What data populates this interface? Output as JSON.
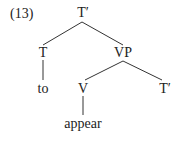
{
  "example_number": "(13)",
  "tree": {
    "root": {
      "label": "T′"
    },
    "t_head": {
      "label": "T",
      "terminal": "to"
    },
    "vp": {
      "label": "VP"
    },
    "v_head": {
      "label": "V",
      "terminal": "appear"
    },
    "t_bar_complement": {
      "label": "T′"
    }
  },
  "colors": {
    "ink": "#222222",
    "line": "#333333",
    "background": "#ffffff"
  }
}
